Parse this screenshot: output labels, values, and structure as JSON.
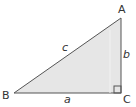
{
  "diagram": {
    "type": "right-triangle",
    "vertices": {
      "A": {
        "label": "A",
        "x": 121,
        "y": 18
      },
      "B": {
        "label": "B",
        "x": 14,
        "y": 93
      },
      "C": {
        "label": "C",
        "x": 121,
        "y": 93
      }
    },
    "sides": {
      "a": {
        "label": "a",
        "between": [
          "B",
          "C"
        ]
      },
      "b": {
        "label": "b",
        "between": [
          "A",
          "C"
        ]
      },
      "c": {
        "label": "c",
        "between": [
          "A",
          "B"
        ]
      }
    },
    "right_angle_at": "C",
    "colors": {
      "fill": "#e6e6e6",
      "stroke": "#555555",
      "text": "#333333"
    }
  }
}
